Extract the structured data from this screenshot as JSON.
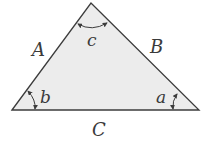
{
  "diagram": {
    "type": "triangle",
    "colors": {
      "fill": "#ececec",
      "stroke": "#3c3c3c",
      "label": "#3a3a3a"
    },
    "vertices": {
      "left": [
        12,
        110
      ],
      "top": [
        91,
        3
      ],
      "right": [
        199,
        110
      ]
    },
    "sides": [
      {
        "id": "A",
        "label": "A",
        "position": "left"
      },
      {
        "id": "B",
        "label": "B",
        "position": "right"
      },
      {
        "id": "C",
        "label": "C",
        "position": "bottom"
      }
    ],
    "angles": [
      {
        "id": "c",
        "label": "c",
        "vertex": "top"
      },
      {
        "id": "b",
        "label": "b",
        "vertex": "left"
      },
      {
        "id": "a",
        "label": "a",
        "vertex": "right"
      }
    ]
  }
}
